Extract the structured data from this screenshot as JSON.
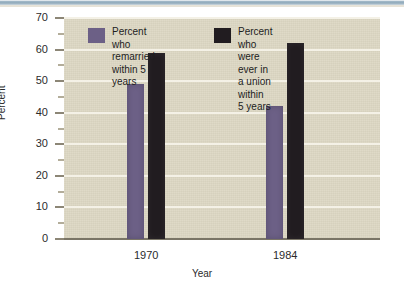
{
  "figure": {
    "background_color": "#ffffff",
    "plot_background_color": "#ddd8c4",
    "gridline_color": "#f4f1e6"
  },
  "chart_data": {
    "type": "bar",
    "title": "",
    "subtitle": "",
    "categories": [
      "1970",
      "1984"
    ],
    "series": [
      {
        "name": "Percent who\nremarried\nwithin 5\nyears",
        "color": "#6c6086",
        "values": [
          49,
          42
        ]
      },
      {
        "name": "Percent who\nwere ever in\na union within\n5 years",
        "color": "#211c20",
        "values": [
          59,
          62
        ]
      }
    ],
    "xlabel": "Year",
    "ylabel": "Percent",
    "ylim": [
      0,
      70
    ],
    "yticks": [
      0,
      10,
      20,
      30,
      40,
      50,
      60,
      70
    ],
    "ytick_labels": [
      "0",
      "10",
      "20",
      "30",
      "40",
      "50",
      "60",
      "70"
    ],
    "yminor_ticks": [
      5,
      15,
      25,
      35,
      45,
      55,
      65
    ],
    "grid": true,
    "legend_position": "upper-center-inside"
  },
  "legend": [
    {
      "swatch_color": "#6c6086",
      "label": "Percent who\nremarried\nwithin 5\nyears"
    },
    {
      "swatch_color": "#211c20",
      "label": "Percent who\nwere ever in\na union within\n5 years"
    }
  ]
}
